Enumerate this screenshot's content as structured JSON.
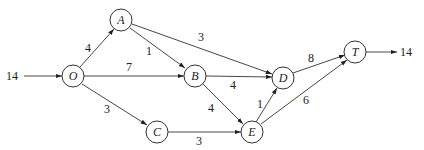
{
  "diagram": {
    "type": "network-flow",
    "nodes": [
      {
        "id": "O",
        "label": "O",
        "x": 73,
        "y": 76
      },
      {
        "id": "A",
        "label": "A",
        "x": 121,
        "y": 20
      },
      {
        "id": "B",
        "label": "B",
        "x": 195,
        "y": 76
      },
      {
        "id": "C",
        "label": "C",
        "x": 157,
        "y": 132
      },
      {
        "id": "D",
        "label": "D",
        "x": 283,
        "y": 78
      },
      {
        "id": "E",
        "label": "E",
        "x": 252,
        "y": 132
      },
      {
        "id": "T",
        "label": "T",
        "x": 355,
        "y": 52
      }
    ],
    "edges": [
      {
        "from": "O",
        "to": "A",
        "weight": "4"
      },
      {
        "from": "O",
        "to": "B",
        "weight": "7"
      },
      {
        "from": "O",
        "to": "C",
        "weight": "3"
      },
      {
        "from": "A",
        "to": "B",
        "weight": "1"
      },
      {
        "from": "A",
        "to": "D",
        "weight": "3"
      },
      {
        "from": "B",
        "to": "D",
        "weight": "4"
      },
      {
        "from": "B",
        "to": "E",
        "weight": "4"
      },
      {
        "from": "C",
        "to": "E",
        "weight": "3"
      },
      {
        "from": "E",
        "to": "D",
        "weight": "1"
      },
      {
        "from": "D",
        "to": "T",
        "weight": "8"
      },
      {
        "from": "E",
        "to": "T",
        "weight": "6"
      }
    ],
    "source_flow": "14",
    "sink_flow": "14"
  }
}
